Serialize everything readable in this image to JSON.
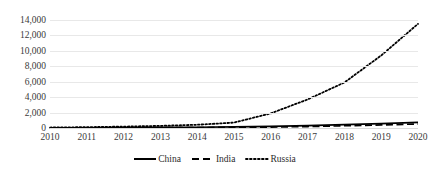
{
  "chart_data": {
    "type": "line",
    "title": "",
    "subtitle": "",
    "xlabel": "",
    "ylabel": "",
    "x": [
      2010,
      2011,
      2012,
      2013,
      2014,
      2015,
      2016,
      2017,
      2018,
      2019,
      2020
    ],
    "xtick_labels": [
      "2010",
      "2011",
      "2012",
      "2013",
      "2014",
      "2015",
      "2016",
      "2017",
      "2018",
      "2019",
      "2020"
    ],
    "ytick_labels": [
      "14,000",
      "12,000",
      "10,000",
      "8,000",
      "6,000",
      "4,000",
      "2,000",
      "0"
    ],
    "ytick_values": [
      14000,
      12000,
      10000,
      8000,
      6000,
      4000,
      2000,
      0
    ],
    "ylim": [
      0,
      14000
    ],
    "xlim": [
      2010,
      2020
    ],
    "grid": true,
    "grid_axis": "y",
    "legend_position": "bottom",
    "series": [
      {
        "name": "China",
        "style": "solid",
        "color": "#000000",
        "values": [
          20,
          30,
          45,
          70,
          100,
          140,
          200,
          300,
          430,
          570,
          720
        ]
      },
      {
        "name": "India",
        "style": "dashed",
        "color": "#000000",
        "values": [
          10,
          18,
          28,
          42,
          60,
          85,
          125,
          190,
          290,
          400,
          520
        ]
      },
      {
        "name": "Russia",
        "style": "dotted",
        "color": "#000000",
        "values": [
          60,
          110,
          180,
          280,
          420,
          700,
          1900,
          3700,
          5900,
          9400,
          13500
        ]
      }
    ]
  },
  "legend": {
    "items": [
      {
        "label": "China",
        "style": "solid"
      },
      {
        "label": "India",
        "style": "dashed"
      },
      {
        "label": "Russia",
        "style": "dotted"
      }
    ]
  }
}
